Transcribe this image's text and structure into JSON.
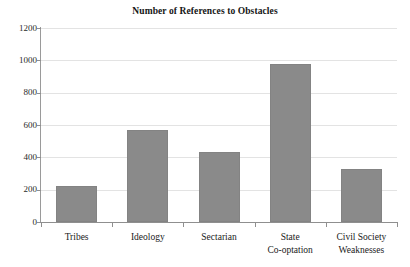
{
  "chart_data": {
    "type": "bar",
    "title": "Number of References to Obstacles",
    "subtitle": "",
    "xlabel": "",
    "ylabel": "",
    "categories": [
      "Tribes",
      "Ideology",
      "Sectarian",
      "State\nCo-optation",
      "Civil Society\nWeaknesses"
    ],
    "values": [
      225,
      567,
      433,
      978,
      325
    ],
    "ylim": [
      0,
      1200
    ],
    "yticks": [
      0,
      200,
      400,
      600,
      800,
      1000,
      1200
    ],
    "ytick_labels": [
      "0",
      "200",
      "400",
      "600",
      "800",
      "1000",
      "1200"
    ],
    "grid": true,
    "grid_axis": "y",
    "legend": false,
    "legend_position": "none",
    "bar_color": "#8a8a8a",
    "gridline_color": "#e3e3e3",
    "axis_color": "#8f8f8f",
    "background_color": "#ffffff"
  }
}
